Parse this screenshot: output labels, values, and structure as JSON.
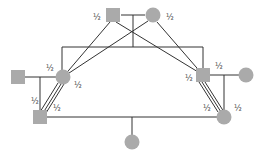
{
  "diagram": {
    "type": "pedigree",
    "colors": {
      "node_fill": "#aaaaaa",
      "edge": "#333333",
      "label": "#444444",
      "background": "#ffffff"
    },
    "nodes": [
      {
        "id": "gf",
        "shape": "square",
        "x": 113,
        "y": 15,
        "label": "½",
        "label_x": 93,
        "label_y": 20
      },
      {
        "id": "gm",
        "shape": "circle",
        "x": 153,
        "y": 15,
        "label": "½",
        "label_x": 166,
        "label_y": 20
      },
      {
        "id": "lm",
        "shape": "square",
        "x": 18,
        "y": 77
      },
      {
        "id": "lc",
        "shape": "circle",
        "x": 63,
        "y": 77,
        "label": "½",
        "label_x": 46,
        "label_y": 71,
        "label2": "½",
        "label2_x": 74,
        "label2_y": 88
      },
      {
        "id": "ls",
        "shape": "square",
        "x": 40,
        "y": 117,
        "label": "½",
        "label_x": 31,
        "label_y": 104,
        "label2": "½",
        "label2_x": 53,
        "label2_y": 111
      },
      {
        "id": "rs",
        "shape": "square",
        "x": 203,
        "y": 75,
        "label": "½",
        "label_x": 185,
        "label_y": 81,
        "label2": "½",
        "label2_x": 215,
        "label2_y": 69
      },
      {
        "id": "rw",
        "shape": "circle",
        "x": 246,
        "y": 75
      },
      {
        "id": "rc",
        "shape": "circle",
        "x": 224,
        "y": 117,
        "label": "½",
        "label_x": 203,
        "label_y": 111,
        "label2": "½",
        "label2_x": 234,
        "label2_y": 111
      },
      {
        "id": "child",
        "shape": "circle",
        "x": 132,
        "y": 142
      }
    ]
  }
}
